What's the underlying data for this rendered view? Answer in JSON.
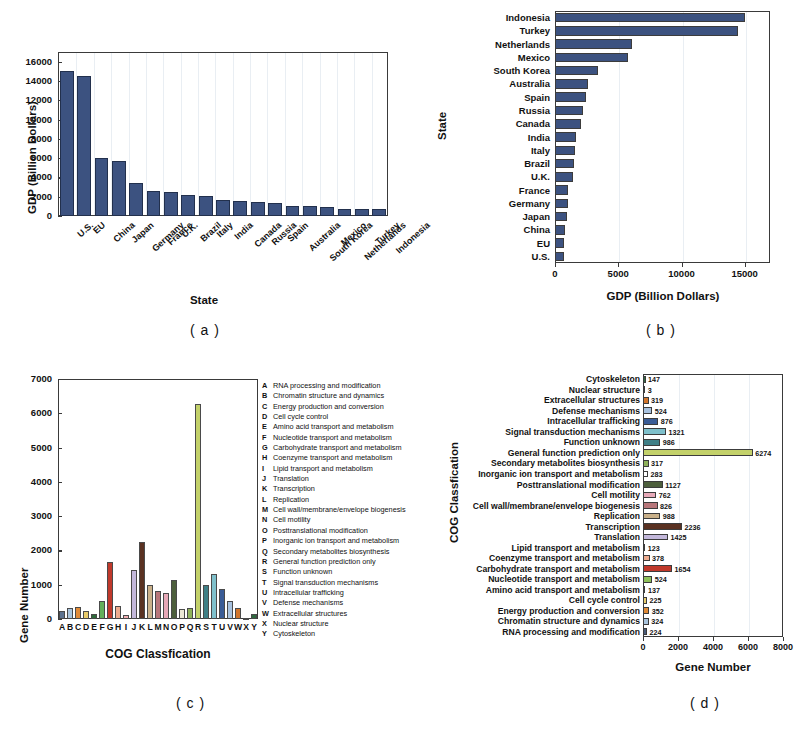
{
  "figure": {
    "captions": {
      "a": "( a )",
      "b": "( b )",
      "c": "( c )",
      "d": "( d )"
    }
  },
  "chart_data": [
    {
      "panel": "a",
      "type": "bar",
      "orientation": "vertical",
      "title": "",
      "xlabel": "State",
      "ylabel": "GDP (Billion Dollars)",
      "ylim": [
        0,
        17000
      ],
      "yticks": [
        0,
        2000,
        4000,
        6000,
        8000,
        10000,
        12000,
        14000,
        16000
      ],
      "ytick_labels": [
        "0",
        "2000",
        "4000",
        "6000",
        "8000",
        "10000",
        "12000",
        "14000",
        "16000"
      ],
      "grid": true,
      "bar_color": "#3c5280",
      "categories": [
        "U.S.",
        "EU",
        "China",
        "Japan",
        "Germany",
        "France",
        "U.K.",
        "Brazil",
        "Italy",
        "India",
        "Canada",
        "Russia",
        "Spain",
        "Australia",
        "South Korea",
        "Mexico",
        "Netherlands",
        "Turkey",
        "Indonesia"
      ],
      "values": [
        15000,
        14500,
        6050,
        5750,
        3400,
        2600,
        2450,
        2200,
        2090,
        1620,
        1570,
        1490,
        1390,
        1040,
        1030,
        960,
        770,
        740,
        710
      ]
    },
    {
      "panel": "b",
      "type": "bar",
      "orientation": "horizontal",
      "title": "",
      "xlabel": "GDP (Billion Dollars)",
      "ylabel": "State",
      "xlim": [
        0,
        17000
      ],
      "xticks": [
        0,
        5000,
        10000,
        15000
      ],
      "xtick_labels": [
        "0",
        "5000",
        "10000",
        "15000"
      ],
      "grid": true,
      "bar_color": "#3c5280",
      "categories": [
        "Indonesia",
        "Turkey",
        "Netherlands",
        "Mexico",
        "South Korea",
        "Australia",
        "Spain",
        "Russia",
        "Canada",
        "India",
        "Italy",
        "Brazil",
        "U.K.",
        "France",
        "Germany",
        "Japan",
        "China",
        "EU",
        "U.S."
      ],
      "values": [
        15000,
        14500,
        6050,
        5750,
        3400,
        2600,
        2450,
        2200,
        2090,
        1620,
        1570,
        1490,
        1390,
        1040,
        1030,
        960,
        770,
        740,
        710
      ]
    },
    {
      "panel": "c",
      "type": "bar",
      "orientation": "vertical",
      "title": "",
      "xlabel": "COG Classfication",
      "ylabel": "Gene Number",
      "ylim": [
        0,
        7000
      ],
      "yticks": [
        0,
        1000,
        2000,
        3000,
        4000,
        5000,
        6000,
        7000
      ],
      "ytick_labels": [
        "0",
        "1000",
        "2000",
        "3000",
        "4000",
        "5000",
        "6000",
        "7000"
      ],
      "grid": false,
      "categories": [
        "A",
        "B",
        "C",
        "D",
        "E",
        "F",
        "G",
        "H",
        "I",
        "J",
        "K",
        "L",
        "M",
        "N",
        "O",
        "P",
        "Q",
        "R",
        "S",
        "T",
        "U",
        "V",
        "W",
        "X",
        "Y"
      ],
      "values": [
        224,
        324,
        352,
        225,
        137,
        524,
        1654,
        378,
        123,
        1425,
        2236,
        988,
        826,
        762,
        1127,
        283,
        317,
        6274,
        986,
        1321,
        876,
        524,
        319,
        3,
        147
      ],
      "colors": [
        "#5d7390",
        "#a9c4dd",
        "#e08a37",
        "#e8cb6a",
        "#2e6b3a",
        "#63b05a",
        "#c0392b",
        "#edab8e",
        "#f3b0b4",
        "#c3b8db",
        "#5a3222",
        "#c9b089",
        "#b7767a",
        "#e7a9b8",
        "#4d5f3c",
        "#ebe8d6",
        "#8fb25a",
        "#c3d16a",
        "#3f7f86",
        "#7fc0cb",
        "#3a5c96",
        "#a8c2df",
        "#d1752c",
        "#efe9d8",
        "#2f6a40"
      ],
      "legend_position": "right",
      "legend": [
        {
          "key": "A",
          "label": "RNA processing and modification"
        },
        {
          "key": "B",
          "label": "Chromatin structure and dynamics"
        },
        {
          "key": "C",
          "label": "Energy production and conversion"
        },
        {
          "key": "D",
          "label": "Cell cycle control"
        },
        {
          "key": "E",
          "label": "Amino acid transport and metabolism"
        },
        {
          "key": "F",
          "label": "Nucleotide transport and metabolism"
        },
        {
          "key": "G",
          "label": "Carbohydrate transport and metabolism"
        },
        {
          "key": "H",
          "label": "Coenzyme transport and metabolism"
        },
        {
          "key": "I",
          "label": "Lipid transport and metabolism"
        },
        {
          "key": "J",
          "label": "Translation"
        },
        {
          "key": "K",
          "label": "Transcription"
        },
        {
          "key": "L",
          "label": "Replication"
        },
        {
          "key": "M",
          "label": "Cell wall/membrane/envelope biogenesis"
        },
        {
          "key": "N",
          "label": "Cell motility"
        },
        {
          "key": "O",
          "label": "Posttranslational modification"
        },
        {
          "key": "P",
          "label": "Inorganic ion transport and metabolism"
        },
        {
          "key": "Q",
          "label": "Secondary metabolites biosynthesis"
        },
        {
          "key": "R",
          "label": "General function prediction only"
        },
        {
          "key": "S",
          "label": "Function unknown"
        },
        {
          "key": "T",
          "label": "Signal transduction mechanisms"
        },
        {
          "key": "U",
          "label": "Intracellular trafficking"
        },
        {
          "key": "V",
          "label": "Defense mechanisms"
        },
        {
          "key": "W",
          "label": "Extracellular structures"
        },
        {
          "key": "X",
          "label": "Nuclear structure"
        },
        {
          "key": "Y",
          "label": "Cytoskeleton"
        }
      ]
    },
    {
      "panel": "d",
      "type": "bar",
      "orientation": "horizontal",
      "title": "",
      "xlabel": "Gene Number",
      "ylabel": "COG Classfication",
      "xlim": [
        0,
        8000
      ],
      "xticks": [
        0,
        2000,
        4000,
        6000,
        8000
      ],
      "xtick_labels": [
        "0",
        "2000",
        "4000",
        "6000",
        "8000"
      ],
      "grid": true,
      "categories": [
        "Cytoskeleton",
        "Nuclear structure",
        "Extracellular structures",
        "Defense mechanisms",
        "Intracellular trafficking",
        "Signal transduction mechanisms",
        "Function unknown",
        "General function prediction only",
        "Secondary metabolites biosynthesis",
        "Inorganic ion transport and metabolism",
        "Posttranslational modification",
        "Cell motility",
        "Cell wall/membrane/envelope biogenesis",
        "Replication",
        "Transcription",
        "Translation",
        "Lipid transport and metabolism",
        "Coenzyme transport and metabolism",
        "Carbohydrate transport and metabolism",
        "Nucleotide transport and metabolism",
        "Amino acid transport and metabolism",
        "Cell cycle control",
        "Energy production and conversion",
        "Chromatin structure and dynamics",
        "RNA processing and modification"
      ],
      "values": [
        147,
        3,
        319,
        524,
        876,
        1321,
        986,
        6274,
        317,
        283,
        1127,
        762,
        826,
        988,
        2236,
        1425,
        123,
        378,
        1654,
        524,
        137,
        225,
        352,
        324,
        224
      ],
      "value_labels": [
        "147",
        "3",
        "319",
        "524",
        "876",
        "1321",
        "986",
        "6274",
        "317",
        "283",
        "1127",
        "762",
        "826",
        "988",
        "2236",
        "1425",
        "123",
        "378",
        "1654",
        "524",
        "137",
        "225",
        "352",
        "324",
        "224"
      ],
      "colors": [
        "#2f6a40",
        "#efe9d8",
        "#d1752c",
        "#a8c2df",
        "#3a5c96",
        "#7fc0cb",
        "#3f7f86",
        "#c3d16a",
        "#8fb25a",
        "#ffffff",
        "#4d5f3c",
        "#e7a9b8",
        "#b7767a",
        "#c9b089",
        "#5a3222",
        "#c3b8db",
        "#3f5f8e",
        "#edab8e",
        "#c0392b",
        "#8fc05a",
        "#2e6b3a",
        "#e8cb6a",
        "#e08a37",
        "#a9c4dd",
        "#4a5c78"
      ]
    }
  ]
}
